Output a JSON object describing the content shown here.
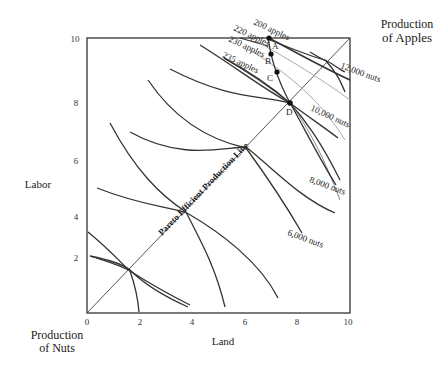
{
  "figure": {
    "corner_top_right": [
      "Production",
      "of Apples"
    ],
    "corner_bottom_left": [
      "Production",
      "of Nuts"
    ],
    "x_axis_label": "Land",
    "y_axis_label": "Labor",
    "x_ticks": [
      "0",
      "2",
      "4",
      "6",
      "8",
      "10"
    ],
    "y_ticks": [
      "2",
      "4",
      "6",
      "8",
      "10"
    ],
    "contract_curve_label": "Pareto Efficient Production Line",
    "points": [
      "A",
      "B",
      "C",
      "D"
    ],
    "apple_isoquants": [
      "200 apples",
      "220 apples",
      "230 apples",
      "235 apples"
    ],
    "nut_isoquants": [
      "6,000 nuts",
      "8,000 nuts",
      "10,000 nuts",
      "12,000 nuts"
    ]
  }
}
